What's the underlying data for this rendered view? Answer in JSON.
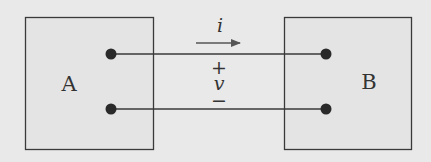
{
  "diagram": {
    "type": "two-port circuit connection",
    "colors": {
      "background": "#e9e9e9",
      "box_fill": "#e4e4e4",
      "stroke": "#3a3a3a",
      "label": "#333333",
      "arrow": "#555555"
    },
    "blocks": [
      {
        "id": "A",
        "label": "A"
      },
      {
        "id": "B",
        "label": "B"
      }
    ],
    "current": {
      "label": "i",
      "direction": "A-to-B"
    },
    "voltage": {
      "label": "v",
      "plus": "+",
      "minus": "−"
    },
    "wires": [
      {
        "name": "top-wire",
        "from": "A",
        "to": "B"
      },
      {
        "name": "bottom-wire",
        "from": "A",
        "to": "B"
      }
    ]
  }
}
